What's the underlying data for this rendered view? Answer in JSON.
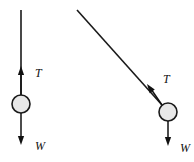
{
  "figure": {
    "background_color": "#ffffff",
    "ink_color": "#111111",
    "bob_fill_color": "#e8e8e8",
    "bob_stroke_color": "#1a1a1a",
    "width": 194,
    "height": 162
  },
  "diagrams": [
    {
      "id": "vertical-case",
      "name": "vertical-string-free-body-diagram",
      "string": {
        "x1": 21,
        "y1": 10,
        "x2": 21,
        "y2": 95
      },
      "bob": {
        "cx": 21,
        "cy": 104,
        "r": 9
      },
      "forces": [
        {
          "symbol": "T",
          "name": "tension",
          "direction": "up",
          "label_x": 35,
          "label_y": 77,
          "shaft": {
            "x1": 21,
            "y1": 95,
            "x2": 21,
            "y2": 69
          },
          "tip": {
            "x": 21,
            "y": 66
          }
        },
        {
          "symbol": "W",
          "name": "weight",
          "direction": "down",
          "label_x": 35,
          "label_y": 150,
          "shaft": {
            "x1": 21,
            "y1": 113,
            "x2": 21,
            "y2": 140
          },
          "tip": {
            "x": 21,
            "y": 145
          }
        }
      ]
    },
    {
      "id": "inclined-case",
      "name": "inclined-string-free-body-diagram",
      "string": {
        "x1": 77,
        "y1": 10,
        "x2": 162,
        "y2": 105
      },
      "bob": {
        "cx": 168,
        "cy": 112,
        "r": 9
      },
      "forces": [
        {
          "symbol": "T",
          "name": "tension",
          "direction": "up-left-along-string",
          "label_x": 163,
          "label_y": 83,
          "shaft": {
            "x1": 162,
            "y1": 105,
            "x2": 151,
            "y2": 89
          },
          "tip": {
            "x": 147,
            "y": 84
          }
        },
        {
          "symbol": "W",
          "name": "weight",
          "direction": "down",
          "label_x": 180,
          "label_y": 152,
          "shaft": {
            "x1": 168,
            "y1": 121,
            "x2": 168,
            "y2": 140
          },
          "tip": {
            "x": 168,
            "y": 146
          }
        }
      ]
    }
  ]
}
